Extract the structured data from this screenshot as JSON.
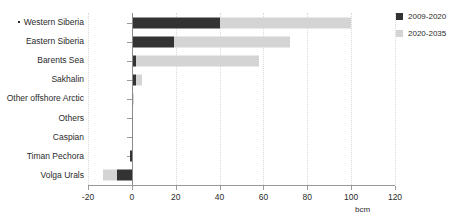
{
  "chart_data": {
    "type": "bar",
    "orientation": "horizontal",
    "stacked": true,
    "title": "",
    "xlabel": "bcm",
    "ylabel": "",
    "xlim": [
      -20,
      120
    ],
    "xticks": [
      -20,
      0,
      20,
      40,
      60,
      80,
      100,
      120
    ],
    "xticklabels": [
      "-20",
      "0",
      "20",
      "40",
      "60",
      "80",
      "100",
      "120"
    ],
    "grid": true,
    "legend_position": "right",
    "categories": [
      "Western Siberia",
      "Eastern Siberia",
      "Barents Sea",
      "Sakhalin",
      "Other offshore Arctic",
      "Others",
      "Caspian",
      "Timan Pechora",
      "Volga Urals"
    ],
    "series": [
      {
        "name": "2009-2020",
        "color": "#333333",
        "values": [
          40,
          19,
          2,
          2,
          0,
          0,
          0,
          -1,
          -7
        ]
      },
      {
        "name": "2020-2035",
        "color": "#d4d4d4",
        "values": [
          60,
          53,
          56,
          2.5,
          1,
          0,
          0,
          0,
          -6
        ]
      }
    ],
    "totals": [
      100,
      72,
      58,
      4.5,
      1,
      0,
      0,
      -1,
      -13
    ]
  },
  "axis": {
    "unit_label": "bcm"
  },
  "legend": {
    "items": [
      {
        "label": "2009-2020",
        "color": "#333333"
      },
      {
        "label": "2020-2035",
        "color": "#d4d4d4"
      }
    ]
  }
}
